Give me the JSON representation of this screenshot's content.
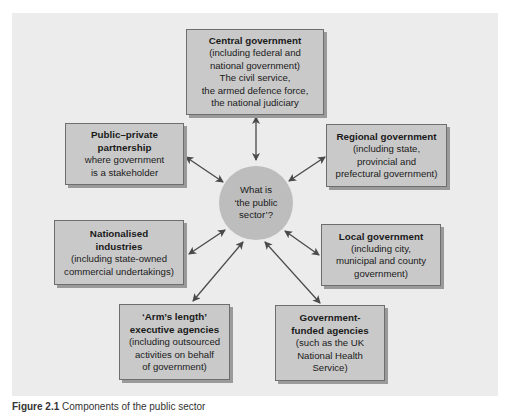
{
  "diagram": {
    "center": {
      "lines": [
        "What is",
        "‘the public",
        "sector’?"
      ]
    },
    "nodes": [
      {
        "id": "central-government",
        "title_lines": [
          "Central government"
        ],
        "body_lines": [
          "(including federal and",
          "national government)",
          "The civil service,",
          "the armed defence force,",
          "the national judiciary"
        ]
      },
      {
        "id": "public-private-partnership",
        "title_lines": [
          "Public–private",
          "partnership"
        ],
        "body_lines": [
          "where government",
          "is a stakeholder"
        ]
      },
      {
        "id": "regional-government",
        "title_lines": [
          "Regional government"
        ],
        "body_lines": [
          "(including state,",
          "provincial and",
          "prefectural government)"
        ]
      },
      {
        "id": "nationalised-industries",
        "title_lines": [
          "Nationalised",
          "industries"
        ],
        "body_lines": [
          "(including state-owned",
          "commercial undertakings)"
        ]
      },
      {
        "id": "local-government",
        "title_lines": [
          "Local government"
        ],
        "body_lines": [
          "(including city,",
          "municipal and county",
          "government)"
        ]
      },
      {
        "id": "arms-length-agencies",
        "title_lines": [
          "‘Arm’s length’",
          "executive agencies"
        ],
        "body_lines": [
          "(including outsourced",
          "activities on behalf",
          "of government)"
        ]
      },
      {
        "id": "government-funded-agencies",
        "title_lines": [
          "Government-",
          "funded agencies"
        ],
        "body_lines": [
          "(such as the UK",
          "National Health",
          "Service)"
        ]
      }
    ],
    "edges": [
      {
        "from": "center",
        "to": "central-government",
        "type": "bidirectional-arrow"
      },
      {
        "from": "center",
        "to": "public-private-partnership",
        "type": "bidirectional-arrow"
      },
      {
        "from": "center",
        "to": "regional-government",
        "type": "bidirectional-arrow"
      },
      {
        "from": "center",
        "to": "nationalised-industries",
        "type": "bidirectional-arrow"
      },
      {
        "from": "center",
        "to": "local-government",
        "type": "bidirectional-arrow"
      },
      {
        "from": "center",
        "to": "arms-length-agencies",
        "type": "bidirectional-arrow"
      },
      {
        "from": "center",
        "to": "government-funded-agencies",
        "type": "bidirectional-arrow"
      }
    ],
    "colors": {
      "panel_bg": "#ececec",
      "box_fill": "#c9c9c9",
      "box_border": "#6e6e6e",
      "circle_fill": "#bdbdbd",
      "arrow": "#4a4a4a"
    }
  },
  "caption": {
    "label": "Figure 2.1",
    "text": "Components of the public sector"
  }
}
